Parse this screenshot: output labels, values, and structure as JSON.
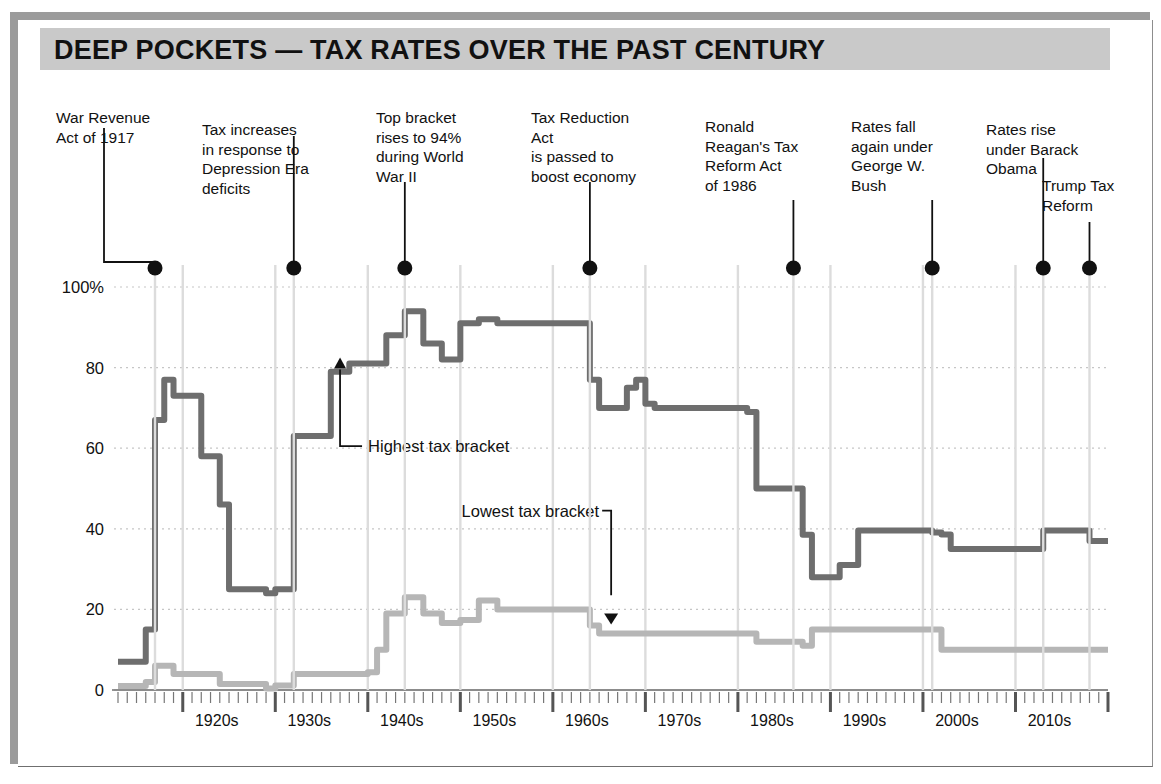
{
  "title": "DEEP POCKETS — TAX RATES OVER THE PAST CENTURY",
  "colors": {
    "banner": "#c9c9c9",
    "highest_line": "#6e6e6e",
    "lowest_line": "#b6b6b6",
    "grid": "#c6c6c6",
    "axis": "#6f6f6f",
    "annotation": "#111111"
  },
  "annotations": [
    {
      "id": "war-revenue-act",
      "text": "War Revenue\nAct of 1917",
      "year": 1917
    },
    {
      "id": "depression-era",
      "text": "Tax increases\nin response to\nDepression Era\ndeficits",
      "year": 1932
    },
    {
      "id": "world-war-two",
      "text": "Top bracket\nrises to 94%\nduring World\nWar II",
      "year": 1944
    },
    {
      "id": "tax-reduction-act",
      "text": "Tax Reduction\nAct\nis passed to\nboost economy",
      "year": 1964
    },
    {
      "id": "reagan-tax-reform",
      "text": "Ronald\nReagan's Tax\nReform Act\nof 1986",
      "year": 1986
    },
    {
      "id": "george-w-bush",
      "text": "Rates fall\nagain under\nGeorge W.\nBush",
      "year": 2001
    },
    {
      "id": "barack-obama",
      "text": "Rates rise\nunder Barack\nObama",
      "year": 2013
    },
    {
      "id": "trump-tax-reform",
      "text": "Trump Tax\nReform",
      "year": 2018
    }
  ],
  "series_labels": {
    "highest": "Highest tax bracket",
    "lowest": "Lowest tax bracket"
  },
  "chart_data": {
    "type": "line",
    "title": "DEEP POCKETS — TAX RATES OVER THE PAST CENTURY",
    "xlabel": "",
    "ylabel": "",
    "xlim": [
      1913,
      2020
    ],
    "ylim": [
      0,
      105
    ],
    "yticks": [
      0,
      20,
      40,
      60,
      80,
      100
    ],
    "ytick_labels": [
      "0",
      "20",
      "40",
      "60",
      "80",
      "100%"
    ],
    "xticks": [
      1920,
      1930,
      1940,
      1950,
      1960,
      1970,
      1980,
      1990,
      2000,
      2010
    ],
    "xtick_labels": [
      "1920s",
      "1930s",
      "1940s",
      "1950s",
      "1960s",
      "1970s",
      "1980s",
      "1990s",
      "2000s",
      "2010s"
    ],
    "minor_tick_interval": 1,
    "grid": true,
    "legend": "inline-annotated",
    "step": "post",
    "series": [
      {
        "name": "Highest tax bracket",
        "color": "#6e6e6e",
        "points": [
          [
            1913,
            7
          ],
          [
            1916,
            15
          ],
          [
            1917,
            67
          ],
          [
            1918,
            77
          ],
          [
            1919,
            73
          ],
          [
            1922,
            58
          ],
          [
            1924,
            46
          ],
          [
            1925,
            25
          ],
          [
            1929,
            24
          ],
          [
            1930,
            25
          ],
          [
            1932,
            63
          ],
          [
            1936,
            79
          ],
          [
            1938,
            81
          ],
          [
            1940,
            81
          ],
          [
            1941,
            81
          ],
          [
            1942,
            88
          ],
          [
            1944,
            94
          ],
          [
            1946,
            86
          ],
          [
            1948,
            82
          ],
          [
            1950,
            91
          ],
          [
            1952,
            92
          ],
          [
            1954,
            91
          ],
          [
            1964,
            77
          ],
          [
            1965,
            70
          ],
          [
            1968,
            75
          ],
          [
            1969,
            77
          ],
          [
            1970,
            71
          ],
          [
            1971,
            70
          ],
          [
            1981,
            69
          ],
          [
            1982,
            50
          ],
          [
            1987,
            38.5
          ],
          [
            1988,
            28
          ],
          [
            1991,
            31
          ],
          [
            1993,
            39.6
          ],
          [
            2001,
            39.1
          ],
          [
            2002,
            38.6
          ],
          [
            2003,
            35
          ],
          [
            2013,
            39.6
          ],
          [
            2018,
            37
          ],
          [
            2020,
            37
          ]
        ]
      },
      {
        "name": "Lowest tax bracket",
        "color": "#b6b6b6",
        "points": [
          [
            1913,
            1
          ],
          [
            1916,
            2
          ],
          [
            1917,
            6
          ],
          [
            1919,
            4
          ],
          [
            1922,
            4
          ],
          [
            1924,
            1.5
          ],
          [
            1926,
            1.5
          ],
          [
            1929,
            0.375
          ],
          [
            1930,
            1.125
          ],
          [
            1932,
            4
          ],
          [
            1936,
            4
          ],
          [
            1940,
            4.4
          ],
          [
            1941,
            10
          ],
          [
            1942,
            19
          ],
          [
            1944,
            23
          ],
          [
            1946,
            19
          ],
          [
            1948,
            16.6
          ],
          [
            1950,
            17.4
          ],
          [
            1952,
            22.2
          ],
          [
            1954,
            20
          ],
          [
            1964,
            16
          ],
          [
            1965,
            14
          ],
          [
            1968,
            14
          ],
          [
            1971,
            14
          ],
          [
            1979,
            14
          ],
          [
            1982,
            12
          ],
          [
            1987,
            11
          ],
          [
            1988,
            15
          ],
          [
            1991,
            15
          ],
          [
            1993,
            15
          ],
          [
            2001,
            15
          ],
          [
            2002,
            10
          ],
          [
            2003,
            10
          ],
          [
            2013,
            10
          ],
          [
            2018,
            10
          ],
          [
            2020,
            10
          ]
        ]
      }
    ]
  }
}
